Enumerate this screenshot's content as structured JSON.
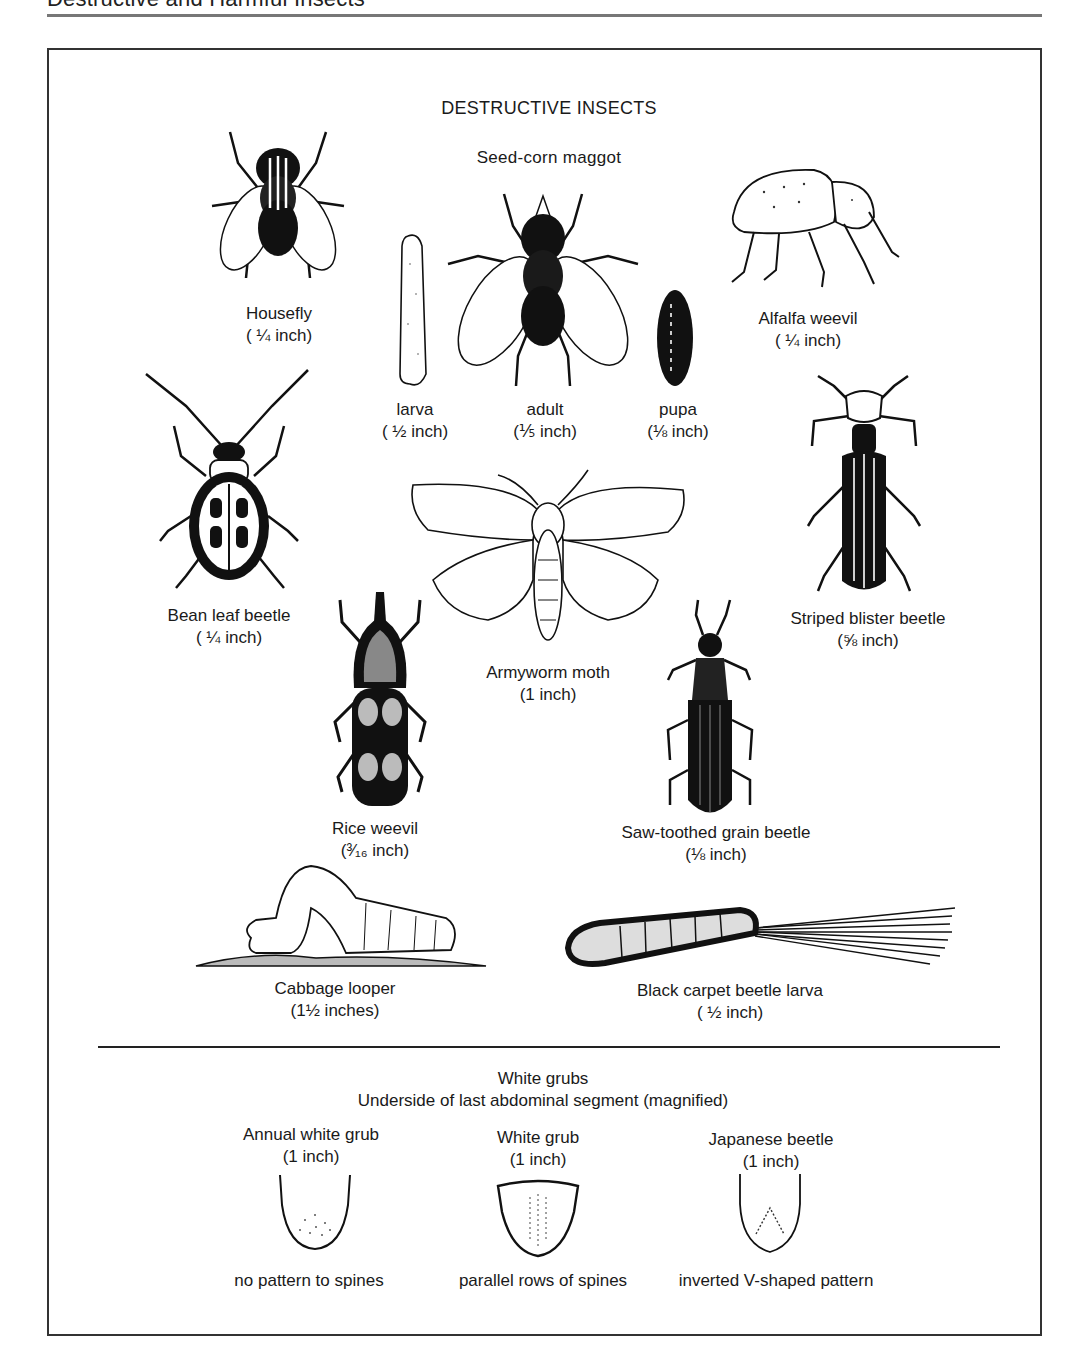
{
  "page": {
    "header": "Destructive and Harmful Insects",
    "section_title": "DESTRUCTIVE INSECTS"
  },
  "insects": {
    "housefly": {
      "name": "Housefly",
      "size": "( ¼ inch)"
    },
    "seed_corn_maggot": {
      "name": "Seed-corn maggot",
      "stages": [
        {
          "name": "larva",
          "size": "( ½ inch)"
        },
        {
          "name": "adult",
          "size": "(⅕ inch)"
        },
        {
          "name": "pupa",
          "size": "(⅛ inch)"
        }
      ]
    },
    "alfalfa_weevil": {
      "name": "Alfalfa weevil",
      "size": "( ¼ inch)"
    },
    "bean_leaf_beetle": {
      "name": "Bean leaf beetle",
      "size": "( ¼ inch)"
    },
    "striped_blister_beetle": {
      "name": "Striped blister beetle",
      "size": "(⅝ inch)"
    },
    "armyworm_moth": {
      "name": "Armyworm moth",
      "size": "(1 inch)"
    },
    "rice_weevil": {
      "name": "Rice weevil",
      "size": "(³⁄₁₆ inch)"
    },
    "saw_toothed_grain_beetle": {
      "name": "Saw-toothed grain beetle",
      "size": "(⅛ inch)"
    },
    "cabbage_looper": {
      "name": "Cabbage looper",
      "size": "(1½ inches)"
    },
    "black_carpet_beetle_larva": {
      "name": "Black carpet beetle larva",
      "size": "( ½ inch)"
    }
  },
  "white_grubs": {
    "title": "White grubs",
    "subtitle": "Underside of last abdominal segment (magnified)",
    "items": [
      {
        "name": "Annual white grub",
        "size": "(1 inch)",
        "pattern": "no pattern to spines"
      },
      {
        "name": "White grub",
        "size": "(1 inch)",
        "pattern": "parallel rows of spines"
      },
      {
        "name": "Japanese beetle",
        "size": "(1 inch)",
        "pattern": "inverted V-shaped pattern"
      }
    ]
  }
}
